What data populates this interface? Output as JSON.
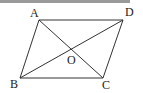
{
  "figure": {
    "type": "parallelogram-with-diagonals",
    "points": {
      "A": {
        "label": "A",
        "x": 39,
        "y": 20
      },
      "B": {
        "label": "B",
        "x": 20,
        "y": 78
      },
      "C": {
        "label": "C",
        "x": 103,
        "y": 78
      },
      "D": {
        "label": "D",
        "x": 123,
        "y": 20
      },
      "O": {
        "label": "O",
        "x": 71,
        "y": 49
      }
    },
    "labels": {
      "A": "A",
      "B": "B",
      "C": "C",
      "D": "D",
      "O": "O"
    },
    "stroke_color": "#333333"
  }
}
